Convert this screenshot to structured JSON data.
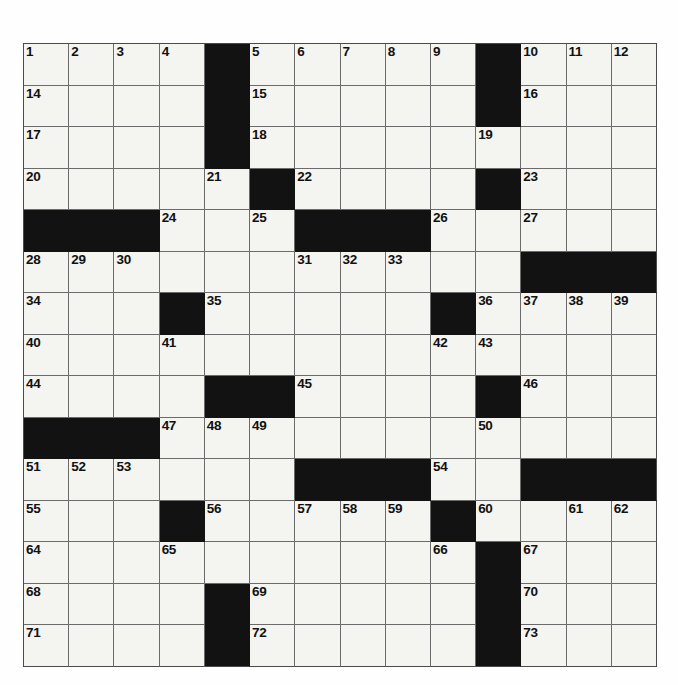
{
  "puzzle": {
    "type": "crossword-grid",
    "title": "",
    "rows": 15,
    "columns": 14,
    "cell_size_px": 45,
    "colors": {
      "block": "#121212",
      "open_cell": "#f4f4f1",
      "grid_line": "#6b6b6b",
      "border": "#4a4a4a",
      "number_text": "#111111",
      "page_background": "#fefefe"
    },
    "max_clue_number": 73,
    "grid": [
      [
        {
          "block": false,
          "number": "1"
        },
        {
          "block": false,
          "number": "2"
        },
        {
          "block": false,
          "number": "3"
        },
        {
          "block": false,
          "number": "4"
        },
        {
          "block": true,
          "number": ""
        },
        {
          "block": false,
          "number": "5"
        },
        {
          "block": false,
          "number": "6"
        },
        {
          "block": false,
          "number": "7"
        },
        {
          "block": false,
          "number": "8"
        },
        {
          "block": false,
          "number": "9"
        },
        {
          "block": true,
          "number": ""
        },
        {
          "block": false,
          "number": "10"
        },
        {
          "block": false,
          "number": "11"
        },
        {
          "block": false,
          "number": "12"
        }
      ],
      [
        {
          "block": false,
          "number": "14"
        },
        {
          "block": false,
          "number": ""
        },
        {
          "block": false,
          "number": ""
        },
        {
          "block": false,
          "number": ""
        },
        {
          "block": true,
          "number": ""
        },
        {
          "block": false,
          "number": "15"
        },
        {
          "block": false,
          "number": ""
        },
        {
          "block": false,
          "number": ""
        },
        {
          "block": false,
          "number": ""
        },
        {
          "block": false,
          "number": ""
        },
        {
          "block": true,
          "number": ""
        },
        {
          "block": false,
          "number": "16"
        },
        {
          "block": false,
          "number": ""
        },
        {
          "block": false,
          "number": ""
        }
      ],
      [
        {
          "block": false,
          "number": "17"
        },
        {
          "block": false,
          "number": ""
        },
        {
          "block": false,
          "number": ""
        },
        {
          "block": false,
          "number": ""
        },
        {
          "block": true,
          "number": ""
        },
        {
          "block": false,
          "number": "18"
        },
        {
          "block": false,
          "number": ""
        },
        {
          "block": false,
          "number": ""
        },
        {
          "block": false,
          "number": ""
        },
        {
          "block": false,
          "number": ""
        },
        {
          "block": false,
          "number": "19"
        },
        {
          "block": false,
          "number": ""
        },
        {
          "block": false,
          "number": ""
        },
        {
          "block": false,
          "number": ""
        }
      ],
      [
        {
          "block": false,
          "number": "20"
        },
        {
          "block": false,
          "number": ""
        },
        {
          "block": false,
          "number": ""
        },
        {
          "block": false,
          "number": ""
        },
        {
          "block": false,
          "number": "21"
        },
        {
          "block": true,
          "number": ""
        },
        {
          "block": false,
          "number": "22"
        },
        {
          "block": false,
          "number": ""
        },
        {
          "block": false,
          "number": ""
        },
        {
          "block": false,
          "number": ""
        },
        {
          "block": true,
          "number": ""
        },
        {
          "block": false,
          "number": "23"
        },
        {
          "block": false,
          "number": ""
        },
        {
          "block": false,
          "number": ""
        }
      ],
      [
        {
          "block": true,
          "number": ""
        },
        {
          "block": true,
          "number": ""
        },
        {
          "block": true,
          "number": ""
        },
        {
          "block": false,
          "number": "24"
        },
        {
          "block": false,
          "number": ""
        },
        {
          "block": false,
          "number": "25"
        },
        {
          "block": true,
          "number": ""
        },
        {
          "block": true,
          "number": ""
        },
        {
          "block": true,
          "number": ""
        },
        {
          "block": false,
          "number": "26"
        },
        {
          "block": false,
          "number": ""
        },
        {
          "block": false,
          "number": "27"
        },
        {
          "block": false,
          "number": ""
        },
        {
          "block": false,
          "number": ""
        }
      ],
      [
        {
          "block": false,
          "number": "28"
        },
        {
          "block": false,
          "number": "29"
        },
        {
          "block": false,
          "number": "30"
        },
        {
          "block": false,
          "number": ""
        },
        {
          "block": false,
          "number": ""
        },
        {
          "block": false,
          "number": ""
        },
        {
          "block": false,
          "number": "31"
        },
        {
          "block": false,
          "number": "32"
        },
        {
          "block": false,
          "number": "33"
        },
        {
          "block": false,
          "number": ""
        },
        {
          "block": false,
          "number": ""
        },
        {
          "block": true,
          "number": ""
        },
        {
          "block": true,
          "number": ""
        },
        {
          "block": true,
          "number": ""
        }
      ],
      [
        {
          "block": false,
          "number": "34"
        },
        {
          "block": false,
          "number": ""
        },
        {
          "block": false,
          "number": ""
        },
        {
          "block": true,
          "number": ""
        },
        {
          "block": false,
          "number": "35"
        },
        {
          "block": false,
          "number": ""
        },
        {
          "block": false,
          "number": ""
        },
        {
          "block": false,
          "number": ""
        },
        {
          "block": false,
          "number": ""
        },
        {
          "block": true,
          "number": ""
        },
        {
          "block": false,
          "number": "36"
        },
        {
          "block": false,
          "number": "37"
        },
        {
          "block": false,
          "number": "38"
        },
        {
          "block": false,
          "number": "39"
        }
      ],
      [
        {
          "block": false,
          "number": "40"
        },
        {
          "block": false,
          "number": ""
        },
        {
          "block": false,
          "number": ""
        },
        {
          "block": false,
          "number": "41"
        },
        {
          "block": false,
          "number": ""
        },
        {
          "block": false,
          "number": ""
        },
        {
          "block": false,
          "number": ""
        },
        {
          "block": false,
          "number": ""
        },
        {
          "block": false,
          "number": ""
        },
        {
          "block": false,
          "number": "42"
        },
        {
          "block": false,
          "number": "43"
        },
        {
          "block": false,
          "number": ""
        },
        {
          "block": false,
          "number": ""
        },
        {
          "block": false,
          "number": ""
        }
      ],
      [
        {
          "block": false,
          "number": "44"
        },
        {
          "block": false,
          "number": ""
        },
        {
          "block": false,
          "number": ""
        },
        {
          "block": false,
          "number": ""
        },
        {
          "block": true,
          "number": ""
        },
        {
          "block": true,
          "number": ""
        },
        {
          "block": false,
          "number": "45"
        },
        {
          "block": false,
          "number": ""
        },
        {
          "block": false,
          "number": ""
        },
        {
          "block": false,
          "number": ""
        },
        {
          "block": true,
          "number": ""
        },
        {
          "block": false,
          "number": "46"
        },
        {
          "block": false,
          "number": ""
        },
        {
          "block": false,
          "number": ""
        }
      ],
      [
        {
          "block": true,
          "number": ""
        },
        {
          "block": true,
          "number": ""
        },
        {
          "block": true,
          "number": ""
        },
        {
          "block": false,
          "number": "47"
        },
        {
          "block": false,
          "number": "48"
        },
        {
          "block": false,
          "number": "49"
        },
        {
          "block": false,
          "number": ""
        },
        {
          "block": false,
          "number": ""
        },
        {
          "block": false,
          "number": ""
        },
        {
          "block": false,
          "number": ""
        },
        {
          "block": false,
          "number": "50"
        },
        {
          "block": false,
          "number": ""
        },
        {
          "block": false,
          "number": ""
        },
        {
          "block": false,
          "number": ""
        }
      ],
      [
        {
          "block": false,
          "number": "51"
        },
        {
          "block": false,
          "number": "52"
        },
        {
          "block": false,
          "number": "53"
        },
        {
          "block": false,
          "number": ""
        },
        {
          "block": false,
          "number": ""
        },
        {
          "block": false,
          "number": ""
        },
        {
          "block": true,
          "number": ""
        },
        {
          "block": true,
          "number": ""
        },
        {
          "block": true,
          "number": ""
        },
        {
          "block": false,
          "number": "54"
        },
        {
          "block": false,
          "number": ""
        },
        {
          "block": true,
          "number": ""
        },
        {
          "block": true,
          "number": ""
        },
        {
          "block": true,
          "number": ""
        }
      ],
      [
        {
          "block": false,
          "number": "55"
        },
        {
          "block": false,
          "number": ""
        },
        {
          "block": false,
          "number": ""
        },
        {
          "block": true,
          "number": ""
        },
        {
          "block": false,
          "number": "56"
        },
        {
          "block": false,
          "number": ""
        },
        {
          "block": false,
          "number": "57"
        },
        {
          "block": false,
          "number": "58"
        },
        {
          "block": false,
          "number": "59"
        },
        {
          "block": true,
          "number": ""
        },
        {
          "block": false,
          "number": "60"
        },
        {
          "block": false,
          "number": ""
        },
        {
          "block": false,
          "number": "61"
        },
        {
          "block": false,
          "number": "62"
        }
      ],
      [
        {
          "block": false,
          "number": "64"
        },
        {
          "block": false,
          "number": ""
        },
        {
          "block": false,
          "number": ""
        },
        {
          "block": false,
          "number": "65"
        },
        {
          "block": false,
          "number": ""
        },
        {
          "block": false,
          "number": ""
        },
        {
          "block": false,
          "number": ""
        },
        {
          "block": false,
          "number": ""
        },
        {
          "block": false,
          "number": ""
        },
        {
          "block": false,
          "number": "66"
        },
        {
          "block": true,
          "number": ""
        },
        {
          "block": false,
          "number": "67"
        },
        {
          "block": false,
          "number": ""
        },
        {
          "block": false,
          "number": ""
        }
      ],
      [
        {
          "block": false,
          "number": "68"
        },
        {
          "block": false,
          "number": ""
        },
        {
          "block": false,
          "number": ""
        },
        {
          "block": false,
          "number": ""
        },
        {
          "block": true,
          "number": ""
        },
        {
          "block": false,
          "number": "69"
        },
        {
          "block": false,
          "number": ""
        },
        {
          "block": false,
          "number": ""
        },
        {
          "block": false,
          "number": ""
        },
        {
          "block": false,
          "number": ""
        },
        {
          "block": true,
          "number": ""
        },
        {
          "block": false,
          "number": "70"
        },
        {
          "block": false,
          "number": ""
        },
        {
          "block": false,
          "number": ""
        }
      ],
      [
        {
          "block": false,
          "number": "71"
        },
        {
          "block": false,
          "number": ""
        },
        {
          "block": false,
          "number": ""
        },
        {
          "block": false,
          "number": ""
        },
        {
          "block": true,
          "number": ""
        },
        {
          "block": false,
          "number": "72"
        },
        {
          "block": false,
          "number": ""
        },
        {
          "block": false,
          "number": ""
        },
        {
          "block": false,
          "number": ""
        },
        {
          "block": false,
          "number": ""
        },
        {
          "block": true,
          "number": ""
        },
        {
          "block": false,
          "number": "73"
        },
        {
          "block": false,
          "number": ""
        },
        {
          "block": false,
          "number": ""
        }
      ]
    ],
    "extra_numbers": {
      "row_1_col_13": "13",
      "row_12_col_13": "63"
    }
  }
}
